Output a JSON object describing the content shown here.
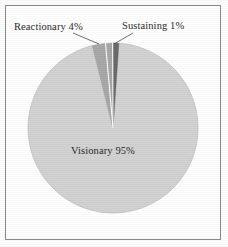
{
  "figure": {
    "background_color": "#ffffff",
    "frame_color": "#8a8a8a"
  },
  "chart_data": {
    "type": "pie",
    "title": "",
    "subtitle": "",
    "xlabel": "",
    "ylabel": "",
    "legend_position": "none",
    "grid": false,
    "labels_inline": true,
    "categories": [
      "Visionary",
      "Reactionary",
      "Sustaining"
    ],
    "values": [
      95,
      4,
      1
    ],
    "value_unit": "%",
    "colors": [
      "#d2d2d2",
      "#a8a8a8",
      "#6a6a6a"
    ],
    "slice_separator_color": "#ffffff",
    "start_angle_deg": -90,
    "direction": "clockwise",
    "annotations": [
      {
        "name": "reactionary",
        "text": "Reactionary 4%",
        "category": "Reactionary",
        "value": 4,
        "placement": "outside-left",
        "leader_line": true
      },
      {
        "name": "sustaining",
        "text": "Sustaining 1%",
        "category": "Sustaining",
        "value": 1,
        "placement": "outside-right",
        "leader_line": true
      },
      {
        "name": "visionary",
        "text": "Visionary 95%",
        "category": "Visionary",
        "value": 95,
        "placement": "inside",
        "leader_line": false
      }
    ]
  },
  "labels": {
    "reactionary": "Reactionary 4%",
    "sustaining": "Sustaining 1%",
    "visionary": "Visionary 95%"
  }
}
